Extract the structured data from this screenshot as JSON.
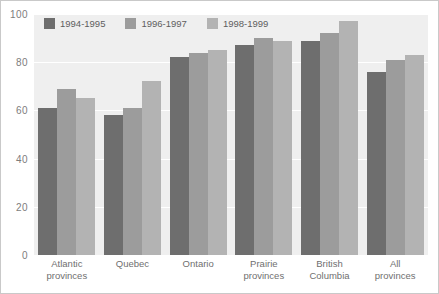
{
  "chart_data": {
    "type": "bar",
    "title": "",
    "xlabel": "",
    "ylabel": "",
    "ylim": [
      0,
      100
    ],
    "yticks": [
      "0",
      "20",
      "40",
      "60",
      "80",
      "100"
    ],
    "grid": true,
    "legend_position": "top-left",
    "categories": [
      "Atlantic provinces",
      "Quebec",
      "Ontario",
      "Prairie provinces",
      "British Columbia",
      "All provinces"
    ],
    "category_lines": [
      [
        "Atlantic",
        "provinces"
      ],
      [
        "Quebec",
        ""
      ],
      [
        "Ontario",
        ""
      ],
      [
        "Prairie",
        "provinces"
      ],
      [
        "British",
        "Columbia"
      ],
      [
        "All",
        "provinces"
      ]
    ],
    "series": [
      {
        "name": "1994-1995",
        "color": "#6e6e6e",
        "values": [
          61,
          58,
          82,
          87,
          89,
          76
        ]
      },
      {
        "name": "1996-1997",
        "color": "#9c9c9c",
        "values": [
          69,
          61,
          84,
          90,
          92,
          81
        ]
      },
      {
        "name": "1998-1999",
        "color": "#b3b3b3",
        "values": [
          65,
          72,
          85,
          89,
          97,
          83
        ]
      }
    ]
  },
  "colors": {
    "plot_background": "#efefef",
    "gridline": "#ffffff",
    "frame": "#c9c9c9",
    "tick_text": "#7d7d7d",
    "category_text": "#6f6f6f",
    "legend_text": "#5e5e5e"
  }
}
